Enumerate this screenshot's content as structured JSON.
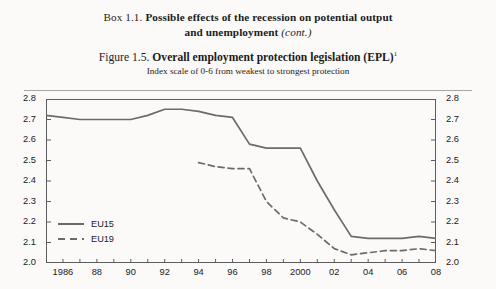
{
  "box": {
    "label": "Box 1.1.",
    "title_line1": "Possible effects of the recession on potential output",
    "title_line2": "and unemployment",
    "cont_note": "(cont.)"
  },
  "figure": {
    "label": "Figure 1.5.",
    "title": "Overall employment protection legislation (EPL)",
    "footnote_marker": "1",
    "subtitle": "Index scale of 0-6 from weakest to strongest protection"
  },
  "colors": {
    "line": "#6b6b6b",
    "frame": "#5d5d5d",
    "rule": "#a9a5a0",
    "text": "#20201f",
    "background": "#fbfaf8"
  },
  "axes": {
    "y_ticks": [
      "2.0",
      "2.1",
      "2.2",
      "2.3",
      "2.4",
      "2.5",
      "2.6",
      "2.7",
      "2.8"
    ],
    "y_min": 2.0,
    "y_max": 2.8,
    "x_ticks": [
      "1986",
      "88",
      "90",
      "92",
      "94",
      "96",
      "98",
      "2000",
      "02",
      "04",
      "06",
      "08"
    ],
    "x_min": 1985,
    "x_max": 2008
  },
  "legend": {
    "items": [
      {
        "label": "EU15",
        "style": "solid"
      },
      {
        "label": "EU19",
        "style": "dashed"
      }
    ]
  },
  "chart_data": {
    "type": "line",
    "title": "Overall employment protection legislation (EPL)",
    "subtitle": "Index scale of 0-6 from weakest to strongest protection",
    "xlabel": "",
    "ylabel": "",
    "ylim": [
      2.0,
      2.8
    ],
    "xlim": [
      1985,
      2008
    ],
    "grid": false,
    "legend_position": "inside-bottom-left",
    "x": [
      1985,
      1986,
      1987,
      1988,
      1989,
      1990,
      1991,
      1992,
      1993,
      1994,
      1995,
      1996,
      1997,
      1998,
      1999,
      2000,
      2001,
      2002,
      2003,
      2004,
      2005,
      2006,
      2007,
      2008
    ],
    "series": [
      {
        "name": "EU15",
        "style": "solid",
        "values": [
          2.72,
          2.71,
          2.7,
          2.7,
          2.7,
          2.7,
          2.72,
          2.75,
          2.75,
          2.74,
          2.72,
          2.71,
          2.58,
          2.56,
          2.56,
          2.56,
          2.4,
          2.26,
          2.13,
          2.12,
          2.12,
          2.12,
          2.13,
          2.12
        ]
      },
      {
        "name": "EU19",
        "style": "dashed",
        "values": [
          null,
          null,
          null,
          null,
          null,
          null,
          null,
          null,
          null,
          2.49,
          2.47,
          2.46,
          2.46,
          2.3,
          2.22,
          2.2,
          2.14,
          2.07,
          2.04,
          2.05,
          2.06,
          2.06,
          2.07,
          2.06
        ]
      }
    ]
  }
}
